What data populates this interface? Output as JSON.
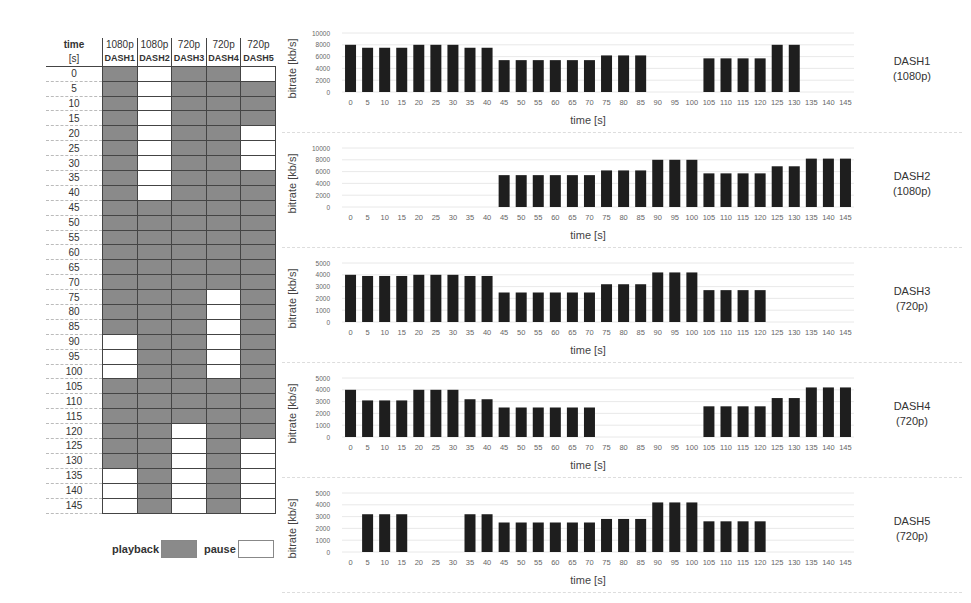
{
  "table": {
    "header_time": "time",
    "header_unit": "[s]",
    "columns": [
      {
        "res": "1080p",
        "name": "DASH1"
      },
      {
        "res": "1080p",
        "name": "DASH2"
      },
      {
        "res": "720p",
        "name": "DASH3"
      },
      {
        "res": "720p",
        "name": "DASH4"
      },
      {
        "res": "720p",
        "name": "DASH5"
      }
    ],
    "times": [
      0,
      5,
      10,
      15,
      20,
      25,
      30,
      35,
      40,
      45,
      50,
      55,
      60,
      65,
      70,
      75,
      80,
      85,
      90,
      95,
      100,
      105,
      110,
      115,
      120,
      125,
      130,
      135,
      140,
      145
    ],
    "states": {
      "DASH1": [
        1,
        1,
        1,
        1,
        1,
        1,
        1,
        1,
        1,
        1,
        1,
        1,
        1,
        1,
        1,
        1,
        1,
        1,
        0,
        0,
        0,
        1,
        1,
        1,
        1,
        1,
        1,
        0,
        0,
        0
      ],
      "DASH2": [
        0,
        0,
        0,
        0,
        0,
        0,
        0,
        0,
        0,
        1,
        1,
        1,
        1,
        1,
        1,
        1,
        1,
        1,
        1,
        1,
        1,
        1,
        1,
        1,
        1,
        1,
        1,
        1,
        1,
        1
      ],
      "DASH3": [
        1,
        1,
        1,
        1,
        1,
        1,
        1,
        1,
        1,
        1,
        1,
        1,
        1,
        1,
        1,
        1,
        1,
        1,
        1,
        1,
        1,
        1,
        1,
        1,
        0,
        0,
        0,
        0,
        0,
        0
      ],
      "DASH4": [
        1,
        1,
        1,
        1,
        1,
        1,
        1,
        1,
        1,
        1,
        1,
        1,
        1,
        1,
        1,
        0,
        0,
        0,
        0,
        0,
        0,
        1,
        1,
        1,
        1,
        1,
        1,
        1,
        1,
        1
      ],
      "DASH5": [
        0,
        1,
        1,
        1,
        0,
        0,
        0,
        1,
        1,
        1,
        1,
        1,
        1,
        1,
        1,
        1,
        1,
        1,
        1,
        1,
        1,
        1,
        1,
        1,
        1,
        0,
        0,
        0,
        0,
        0
      ]
    },
    "legend": {
      "playback": "playback",
      "pause": "pause",
      "playback_color": "#8a8a8a",
      "pause_color": "#ffffff"
    }
  },
  "chart_data": [
    {
      "type": "bar",
      "title": "DASH1 (1080p)",
      "label_line1": "DASH1",
      "label_line2": "(1080p)",
      "xlabel": "time [s]",
      "ylabel": "bitrate [kb/s]",
      "ylim": [
        0,
        10000
      ],
      "yticks": [
        0,
        2000,
        4000,
        6000,
        8000,
        10000
      ],
      "grid": true,
      "categories": [
        0,
        5,
        10,
        15,
        20,
        25,
        30,
        35,
        40,
        45,
        50,
        55,
        60,
        65,
        70,
        75,
        80,
        85,
        90,
        95,
        100,
        105,
        110,
        115,
        120,
        125,
        130,
        135,
        140,
        145
      ],
      "values": [
        8000,
        7500,
        7500,
        7500,
        8000,
        8000,
        8000,
        7500,
        7500,
        5400,
        5400,
        5400,
        5400,
        5400,
        5400,
        6200,
        6200,
        6200,
        0,
        0,
        0,
        5700,
        5700,
        5700,
        5700,
        8000,
        8000,
        0,
        0,
        0
      ]
    },
    {
      "type": "bar",
      "title": "DASH2 (1080p)",
      "label_line1": "DASH2",
      "label_line2": "(1080p)",
      "xlabel": "time [s]",
      "ylabel": "bitrate [kb/s]",
      "ylim": [
        0,
        10000
      ],
      "yticks": [
        0,
        2000,
        4000,
        6000,
        8000,
        10000
      ],
      "grid": true,
      "categories": [
        0,
        5,
        10,
        15,
        20,
        25,
        30,
        35,
        40,
        45,
        50,
        55,
        60,
        65,
        70,
        75,
        80,
        85,
        90,
        95,
        100,
        105,
        110,
        115,
        120,
        125,
        130,
        135,
        140,
        145
      ],
      "values": [
        0,
        0,
        0,
        0,
        0,
        0,
        0,
        0,
        0,
        5400,
        5400,
        5400,
        5400,
        5400,
        5400,
        6200,
        6200,
        6200,
        8000,
        8000,
        8000,
        5700,
        5700,
        5700,
        5700,
        6900,
        6900,
        8200,
        8200,
        8200
      ]
    },
    {
      "type": "bar",
      "title": "DASH3 (720p)",
      "label_line1": "DASH3",
      "label_line2": "(720p)",
      "xlabel": "time [s]",
      "ylabel": "bitrate [kb/s]",
      "ylim": [
        0,
        5000
      ],
      "yticks": [
        0,
        1000,
        2000,
        3000,
        4000,
        5000
      ],
      "grid": true,
      "categories": [
        0,
        5,
        10,
        15,
        20,
        25,
        30,
        35,
        40,
        45,
        50,
        55,
        60,
        65,
        70,
        75,
        80,
        85,
        90,
        95,
        100,
        105,
        110,
        115,
        120,
        125,
        130,
        135,
        140,
        145
      ],
      "values": [
        4000,
        3900,
        3900,
        3900,
        4000,
        4000,
        4000,
        3900,
        3900,
        2500,
        2500,
        2500,
        2500,
        2500,
        2500,
        3200,
        3200,
        3200,
        4200,
        4200,
        4200,
        2700,
        2700,
        2700,
        2700,
        0,
        0,
        0,
        0,
        0
      ]
    },
    {
      "type": "bar",
      "title": "DASH4 (720p)",
      "label_line1": "DASH4",
      "label_line2": "(720p)",
      "xlabel": "time [s]",
      "ylabel": "bitrate [kb/s]",
      "ylim": [
        0,
        5000
      ],
      "yticks": [
        0,
        1000,
        2000,
        3000,
        4000,
        5000
      ],
      "grid": true,
      "categories": [
        0,
        5,
        10,
        15,
        20,
        25,
        30,
        35,
        40,
        45,
        50,
        55,
        60,
        65,
        70,
        75,
        80,
        85,
        90,
        95,
        100,
        105,
        110,
        115,
        120,
        125,
        130,
        135,
        140,
        145
      ],
      "values": [
        4000,
        3100,
        3100,
        3100,
        4000,
        4000,
        4000,
        3200,
        3200,
        2500,
        2500,
        2500,
        2500,
        2500,
        2500,
        0,
        0,
        0,
        0,
        0,
        0,
        2600,
        2600,
        2600,
        2600,
        3300,
        3300,
        4200,
        4200,
        4200
      ]
    },
    {
      "type": "bar",
      "title": "DASH5 (720p)",
      "label_line1": "DASH5",
      "label_line2": "(720p)",
      "xlabel": "time [s]",
      "ylabel": "bitrate [kb/s]",
      "ylim": [
        0,
        5000
      ],
      "yticks": [
        0,
        1000,
        2000,
        3000,
        4000,
        5000
      ],
      "grid": true,
      "categories": [
        0,
        5,
        10,
        15,
        20,
        25,
        30,
        35,
        40,
        45,
        50,
        55,
        60,
        65,
        70,
        75,
        80,
        85,
        90,
        95,
        100,
        105,
        110,
        115,
        120,
        125,
        130,
        135,
        140,
        145
      ],
      "values": [
        0,
        3200,
        3200,
        3200,
        0,
        0,
        0,
        3200,
        3200,
        2500,
        2500,
        2500,
        2500,
        2500,
        2500,
        2800,
        2800,
        2800,
        4200,
        4200,
        4200,
        2600,
        2600,
        2600,
        2600,
        0,
        0,
        0,
        0,
        0
      ]
    }
  ],
  "colors": {
    "bar": "#1e1e1e",
    "grid": "#dddddd",
    "axis_text": "#555555"
  }
}
